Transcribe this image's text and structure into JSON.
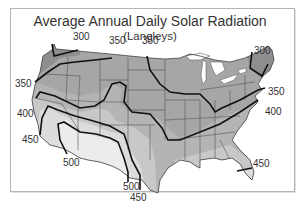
{
  "title": "Average Annual Daily Solar Radiation",
  "subtitle": "(Langleys)",
  "units": "Langleys",
  "contour_labels": [
    {
      "value": "300",
      "x": 73,
      "y": 37
    },
    {
      "value": "350",
      "x": 109,
      "y": 41
    },
    {
      "value": "350",
      "x": 142,
      "y": 41
    },
    {
      "value": "300",
      "x": 254,
      "y": 46
    },
    {
      "value": "350",
      "x": 15,
      "y": 79
    },
    {
      "value": "350",
      "x": 268,
      "y": 87
    },
    {
      "value": "400",
      "x": 17,
      "y": 109
    },
    {
      "value": "400",
      "x": 265,
      "y": 107
    },
    {
      "value": "450",
      "x": 22,
      "y": 135
    },
    {
      "value": "500",
      "x": 63,
      "y": 157
    },
    {
      "value": "500",
      "x": 123,
      "y": 184
    },
    {
      "value": "450",
      "x": 130,
      "y": 195
    },
    {
      "value": "450",
      "x": 253,
      "y": 160
    }
  ],
  "zones": [
    {
      "range": "<300",
      "color": "#8e8e8e"
    },
    {
      "range": "300-350",
      "color": "#a2a2a2"
    },
    {
      "range": "350-400",
      "color": "#b4b4b4"
    },
    {
      "range": "400-450",
      "color": "#c8c8c8"
    },
    {
      "range": "450-500",
      "color": "#dcdcdc"
    },
    {
      "range": ">500",
      "color": "#ececec"
    }
  ]
}
